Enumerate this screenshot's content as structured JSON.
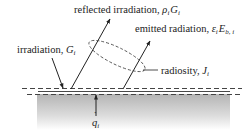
{
  "diagram": {
    "type": "radiation-surface-energy-balance",
    "colors": {
      "line": "#222222",
      "dash": "#444444",
      "solid_gradient_top": "#b8b8b8",
      "solid_gradient_bottom": "#ffffff"
    },
    "labels": {
      "reflected": {
        "text": "reflected irradiation, ",
        "symbol": "ρ",
        "symbol_sub": "i",
        "symbol2": "G",
        "symbol2_sub": "i"
      },
      "emitted": {
        "text": "emitted radiation, ",
        "symbol": "ε",
        "symbol_sub": "i",
        "symbol2": "E",
        "symbol2_sub": "b, i"
      },
      "irradiation": {
        "text": "irradiation, ",
        "symbol": "G",
        "symbol_sub": "i"
      },
      "radiosity": {
        "text": "radiosity, ",
        "symbol": "J",
        "symbol_sub": "i"
      },
      "heat_flux": {
        "symbol": "q",
        "symbol_sub": "i",
        "accent": "˙"
      }
    },
    "elements": [
      {
        "name": "irradiation-arrow",
        "direction": "incoming"
      },
      {
        "name": "reflected-arrow",
        "direction": "outgoing"
      },
      {
        "name": "emitted-arrow",
        "direction": "outgoing"
      },
      {
        "name": "radiosity-ellipse",
        "style": "dashed"
      },
      {
        "name": "surface-line",
        "style": "solid"
      },
      {
        "name": "control-surface-top",
        "style": "dashed"
      },
      {
        "name": "control-surface-bottom",
        "style": "dashed"
      },
      {
        "name": "heat-flux-arrow",
        "direction": "into-surface"
      },
      {
        "name": "solid-body",
        "fill": "gradient"
      }
    ]
  }
}
